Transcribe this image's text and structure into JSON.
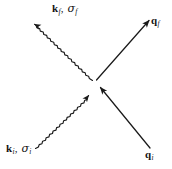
{
  "diagram": {
    "type": "feynman-scattering-diagram",
    "background_color": "#ffffff",
    "line_color": "#1a1a1a",
    "vertex": {
      "x": 94,
      "y": 82
    },
    "labels": {
      "outgoing_particle": {
        "vector": "k",
        "vector_subscript": "f",
        "separator": ", ",
        "spin": "σ",
        "spin_subscript": "f",
        "plain": "k_f, σ_f"
      },
      "incoming_particle": {
        "vector": "k",
        "vector_subscript": "i",
        "separator": ", ",
        "spin": "σ",
        "spin_subscript": "i",
        "plain": "k_i, σ_i"
      },
      "outgoing_momentum": {
        "vector": "q",
        "vector_subscript": "f",
        "plain": "q_f"
      },
      "incoming_momentum": {
        "vector": "q",
        "vector_subscript": "i",
        "plain": "q_i"
      }
    },
    "lines": [
      {
        "name": "outgoing-wavy-line",
        "style": "wavy",
        "direction": "outgoing",
        "from": {
          "x": 94,
          "y": 82
        },
        "to": {
          "x": 33,
          "y": 11
        },
        "arrow_at": "to"
      },
      {
        "name": "incoming-wavy-line",
        "style": "wavy",
        "direction": "incoming",
        "from": {
          "x": 36,
          "y": 148
        },
        "to": {
          "x": 90,
          "y": 87
        },
        "arrow_at": "to"
      },
      {
        "name": "outgoing-straight-line",
        "style": "straight",
        "direction": "outgoing",
        "from": {
          "x": 97,
          "y": 80
        },
        "to": {
          "x": 150,
          "y": 19
        },
        "arrow_at": "to"
      },
      {
        "name": "incoming-straight-line",
        "style": "straight",
        "direction": "incoming",
        "from": {
          "x": 150,
          "y": 148
        },
        "to": {
          "x": 99,
          "y": 86
        },
        "arrow_at": "to"
      }
    ]
  }
}
